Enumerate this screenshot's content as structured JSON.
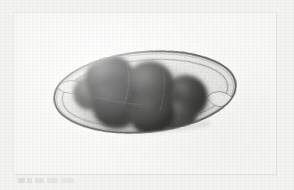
{
  "figure": {
    "domain": "Natural-Image",
    "kind": "light-microscopy-photomicrograph",
    "caption_text": "",
    "background_color": "#f3f3f1",
    "plate_color": "#f8f8f6",
    "plate": {
      "left": 14,
      "top": 13,
      "width": 262,
      "height": 161
    }
  },
  "specimen": {
    "label": "helminth-egg",
    "outline_color": "#6f6f6b",
    "shell_fill": "#e8e8e4",
    "inner_membrane_color": "#8d8d88",
    "center_x": 150,
    "center_y": 92,
    "major_axis": 182,
    "minor_axis": 80,
    "rotation_deg": -5
  },
  "embryo": {
    "label": "morula-cell-mass",
    "cell_count": 7,
    "dark_color": "#2c2c2c",
    "mid_color": "#4a4a48",
    "edge_color": "#6b6b68",
    "cells": [
      {
        "name": "blastomere-1",
        "cx": 116,
        "cy": 78,
        "r": 25
      },
      {
        "name": "blastomere-2",
        "cx": 156,
        "cy": 84,
        "r": 24
      },
      {
        "name": "blastomere-3",
        "cx": 192,
        "cy": 96,
        "r": 22
      },
      {
        "name": "blastomere-4",
        "cx": 122,
        "cy": 104,
        "r": 24
      },
      {
        "name": "blastomere-5",
        "cx": 158,
        "cy": 112,
        "r": 23
      },
      {
        "name": "blastomere-6",
        "cx": 96,
        "cy": 92,
        "r": 17
      },
      {
        "name": "blastomere-7",
        "cx": 186,
        "cy": 116,
        "r": 16
      }
    ]
  },
  "optics": {
    "halo_color": "#ffffff",
    "vignette_color": "#00000012",
    "focus_note": "slightly out-of-focus halo around shell"
  }
}
